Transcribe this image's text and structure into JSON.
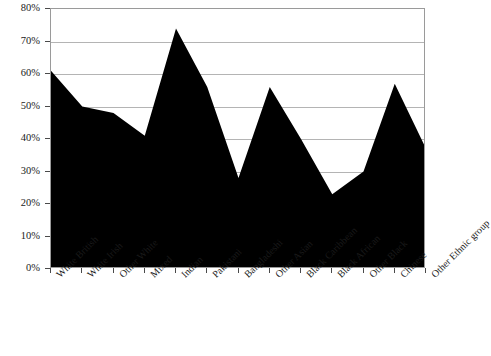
{
  "chart_data": {
    "type": "area",
    "title": "",
    "xlabel": "",
    "ylabel": "",
    "ylim": [
      0,
      80
    ],
    "ytick_step": 10,
    "grid": true,
    "legend": false,
    "legend_position": "none",
    "series_color": "#000000",
    "frame_color": "#9a9a9a",
    "gridline_color": "#b4b4b4",
    "ytick_labels": [
      "80%",
      "70%",
      "60%",
      "50%",
      "40%",
      "30%",
      "20%",
      "10%",
      "0%"
    ],
    "ytick_values": [
      80,
      70,
      60,
      50,
      40,
      30,
      20,
      10,
      0
    ],
    "categories": [
      "White British",
      "White Irish",
      "Other White",
      "Mixed",
      "Indian",
      "Pakistani",
      "Bangladeshi",
      "Other Asian",
      "Black Caribbean",
      "Black African",
      "Other Black",
      "Chinese",
      "Other Ethnic group"
    ],
    "values": [
      61,
      50,
      48,
      41,
      74,
      56,
      28,
      56,
      40,
      23,
      30,
      57,
      37
    ],
    "series": [
      {
        "name": "",
        "values": [
          61,
          50,
          48,
          41,
          74,
          56,
          28,
          56,
          40,
          23,
          30,
          57,
          37
        ]
      }
    ]
  }
}
